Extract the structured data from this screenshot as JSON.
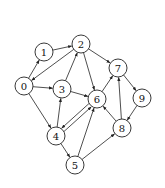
{
  "graph": {
    "type": "directed",
    "node_radius": 9,
    "colors": {
      "stroke": "#222222",
      "fill": "#ffffff",
      "text": "#111111"
    },
    "nodes": [
      {
        "id": "0",
        "label": "0",
        "x": 24,
        "y": 86
      },
      {
        "id": "1",
        "label": "1",
        "x": 44,
        "y": 52
      },
      {
        "id": "2",
        "label": "2",
        "x": 81,
        "y": 44
      },
      {
        "id": "3",
        "label": "3",
        "x": 62,
        "y": 89
      },
      {
        "id": "4",
        "label": "4",
        "x": 56,
        "y": 136
      },
      {
        "id": "5",
        "label": "5",
        "x": 75,
        "y": 165
      },
      {
        "id": "6",
        "label": "6",
        "x": 97,
        "y": 99
      },
      {
        "id": "7",
        "label": "7",
        "x": 118,
        "y": 68
      },
      {
        "id": "8",
        "label": "8",
        "x": 122,
        "y": 128
      },
      {
        "id": "9",
        "label": "9",
        "x": 142,
        "y": 98
      }
    ],
    "edges": [
      {
        "from": "0",
        "to": "1"
      },
      {
        "from": "1",
        "to": "2"
      },
      {
        "from": "2",
        "to": "0"
      },
      {
        "from": "0",
        "to": "3"
      },
      {
        "from": "0",
        "to": "4"
      },
      {
        "from": "3",
        "to": "2"
      },
      {
        "from": "3",
        "to": "6"
      },
      {
        "from": "2",
        "to": "6"
      },
      {
        "from": "2",
        "to": "7"
      },
      {
        "from": "4",
        "to": "3"
      },
      {
        "from": "4",
        "to": "6",
        "offset": 2
      },
      {
        "from": "6",
        "to": "4",
        "offset": 2
      },
      {
        "from": "4",
        "to": "5"
      },
      {
        "from": "5",
        "to": "6"
      },
      {
        "from": "5",
        "to": "8"
      },
      {
        "from": "6",
        "to": "7"
      },
      {
        "from": "7",
        "to": "9"
      },
      {
        "from": "9",
        "to": "8"
      },
      {
        "from": "8",
        "to": "7"
      },
      {
        "from": "8",
        "to": "6"
      }
    ]
  }
}
